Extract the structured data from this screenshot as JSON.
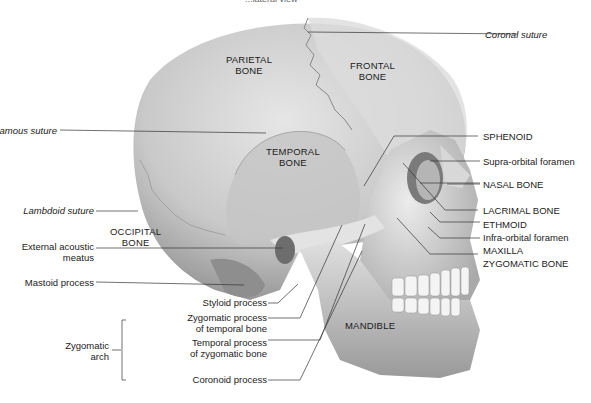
{
  "figure": {
    "caption_fragment": "...lateral view",
    "bone_labels": {
      "parietal": [
        "PARIETAL",
        "BONE"
      ],
      "frontal": [
        "FRONTAL",
        "BONE"
      ],
      "temporal": [
        "TEMPORAL",
        "BONE"
      ],
      "occipital": [
        "OCCIPITAL",
        "BONE"
      ],
      "mandible": "MANDIBLE"
    },
    "left_labels": {
      "squamous": "Squamous suture",
      "lambdoid": "Lambdoid suture",
      "ext_acoustic_1": "External acoustic",
      "ext_acoustic_2": "meatus",
      "mastoid": "Mastoid process"
    },
    "right_labels": {
      "coronal": "Coronal suture",
      "sphenoid": "SPHENOID",
      "supraorbital": "Supra-orbital foramen",
      "nasal": "NASAL BONE",
      "lacrimal": "LACRIMAL BONE",
      "ethmoid": "ETHMOID",
      "infraorbital": "Infra-orbital foramen",
      "maxilla": "MAXILLA",
      "zygomatic": "ZYGOMATIC BONE"
    },
    "bottom_labels": {
      "styloid": "Styloid process",
      "zyg_proc_1": "Zygomatic process",
      "zyg_proc_2": "of temporal bone",
      "temp_proc_1": "Temporal process",
      "temp_proc_2": "of zygomatic bone",
      "coronoid": "Coronoid process",
      "arch_1": "Zygomatic",
      "arch_2": "arch"
    }
  }
}
